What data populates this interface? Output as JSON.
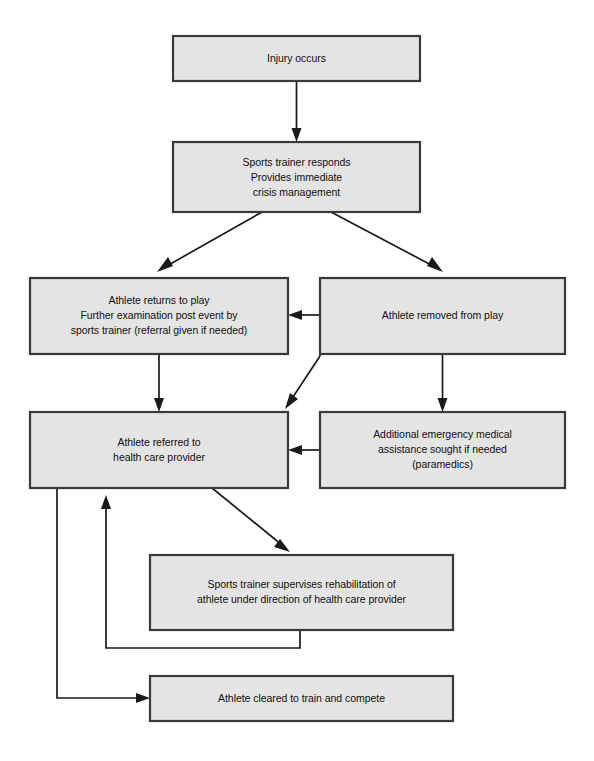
{
  "diagram": {
    "type": "flowchart",
    "background_color": "#ffffff",
    "node_fill_color": "#e4e4e4",
    "node_border_color": "#3a3a3a",
    "connector_color": "#1a1a1a",
    "nodes": [
      {
        "id": "injury",
        "lines": [
          "Injury occurs"
        ],
        "x": 173,
        "y": 36,
        "w": 247,
        "h": 45
      },
      {
        "id": "trainer_responds",
        "lines": [
          "Sports trainer responds",
          "Provides immediate",
          "crisis management"
        ],
        "x": 173,
        "y": 142,
        "w": 247,
        "h": 70
      },
      {
        "id": "returns_to_play",
        "lines": [
          "Athlete returns to play",
          "Further examination post event by",
          "sports trainer (referral given if needed)"
        ],
        "x": 30,
        "y": 278,
        "w": 258,
        "h": 76
      },
      {
        "id": "removed_from_play",
        "lines": [
          "Athlete removed from play"
        ],
        "x": 320,
        "y": 278,
        "w": 245,
        "h": 76
      },
      {
        "id": "referred_provider",
        "lines": [
          "Athlete referred to",
          "health care provider"
        ],
        "x": 30,
        "y": 412,
        "w": 258,
        "h": 76
      },
      {
        "id": "emergency_assistance",
        "lines": [
          "Additional emergency medical",
          "assistance sought if needed",
          "(paramedics)"
        ],
        "x": 320,
        "y": 412,
        "w": 245,
        "h": 76
      },
      {
        "id": "rehabilitation",
        "lines": [
          "Sports trainer supervises rehabilitation of",
          "athlete under direction of health care provider"
        ],
        "x": 150,
        "y": 555,
        "w": 303,
        "h": 75
      },
      {
        "id": "cleared",
        "lines": [
          "Athlete cleared to train and compete"
        ],
        "x": 150,
        "y": 676,
        "w": 303,
        "h": 45
      }
    ],
    "edges": [
      {
        "id": "injury-to-trainer",
        "from": "injury",
        "to": "trainer_responds",
        "label": ""
      },
      {
        "id": "trainer-to-returns",
        "from": "trainer_responds",
        "to": "returns_to_play",
        "label": ""
      },
      {
        "id": "trainer-to-removed",
        "from": "trainer_responds",
        "to": "removed_from_play",
        "label": ""
      },
      {
        "id": "removed-to-returns",
        "from": "removed_from_play",
        "to": "returns_to_play",
        "label": ""
      },
      {
        "id": "returns-to-referred",
        "from": "returns_to_play",
        "to": "referred_provider",
        "label": ""
      },
      {
        "id": "removed-to-referred",
        "from": "removed_from_play",
        "to": "referred_provider",
        "label": ""
      },
      {
        "id": "removed-to-emergency",
        "from": "removed_from_play",
        "to": "emergency_assistance",
        "label": ""
      },
      {
        "id": "emergency-to-referred",
        "from": "emergency_assistance",
        "to": "referred_provider",
        "label": ""
      },
      {
        "id": "referred-to-rehab",
        "from": "referred_provider",
        "to": "rehabilitation",
        "label": ""
      },
      {
        "id": "rehab-to-referred",
        "from": "rehabilitation",
        "to": "referred_provider",
        "label": ""
      },
      {
        "id": "referred-to-cleared",
        "from": "referred_provider",
        "to": "cleared",
        "label": ""
      }
    ]
  }
}
